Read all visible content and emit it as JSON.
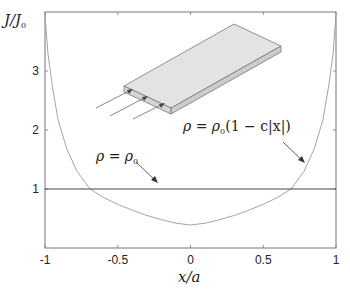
{
  "chart_data": {
    "type": "line",
    "title": "",
    "xlabel": "x/a",
    "ylabel": "J/J0",
    "xlim": [
      -1,
      1
    ],
    "ylim": [
      0,
      4
    ],
    "grid": false,
    "legend": null,
    "x_ticks": [
      -1,
      -0.5,
      0,
      0.5,
      1
    ],
    "x_tick_labels": [
      "-1",
      "-0.5",
      "0",
      "0.5",
      "1"
    ],
    "y_ticks": [
      1,
      2,
      3
    ],
    "y_tick_labels": [
      "1",
      "2",
      "3"
    ],
    "series": [
      {
        "name": "rho = rho0 (1 - c|x|)",
        "color": "#9a9a9a",
        "x": [
          -1.0,
          -0.98,
          -0.95,
          -0.91,
          -0.85,
          -0.78,
          -0.69,
          -0.6,
          -0.5,
          -0.4,
          -0.31,
          -0.2,
          -0.1,
          0.0,
          0.1,
          0.2,
          0.31,
          0.4,
          0.5,
          0.6,
          0.69,
          0.78,
          0.85,
          0.91,
          0.95,
          0.98,
          1.0
        ],
        "y": [
          3.95,
          3.3,
          2.75,
          2.17,
          1.68,
          1.3,
          1.0,
          0.86,
          0.74,
          0.64,
          0.56,
          0.48,
          0.42,
          0.39,
          0.42,
          0.48,
          0.56,
          0.64,
          0.74,
          0.86,
          1.0,
          1.3,
          1.68,
          2.17,
          2.75,
          3.3,
          3.95
        ]
      },
      {
        "name": "rho = rho0",
        "color": "#444444",
        "x": [
          -1,
          1
        ],
        "y": [
          1,
          1
        ]
      }
    ],
    "annotations": [
      {
        "text": "ρ = ρ0",
        "arrow_to": [
          -0.22,
          1.1
        ]
      },
      {
        "text": "ρ = ρ0(1 − c|x|)",
        "arrow_to": [
          0.79,
          1.4
        ]
      },
      {
        "text": "inset: isometric sketch of a thin slab with current arrows entering its end face"
      }
    ]
  },
  "labels": {
    "ylabel_main": "J/J",
    "ylabel_sub": "0",
    "xlabel": "x/a",
    "ann1_lhs": "ρ = ρ",
    "ann1_sub": "0",
    "ann2_lhs": "ρ = ρ",
    "ann2_sub": "0",
    "ann2_rest": "(1 − c|x|)"
  }
}
